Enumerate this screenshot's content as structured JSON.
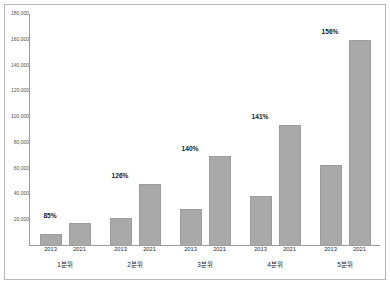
{
  "chart_data": {
    "type": "bar",
    "title": "",
    "subtitle": "",
    "xlabel": "",
    "ylabel": "",
    "categories": [
      "1분위",
      "2분위",
      "3분위",
      "4분위",
      "5분위"
    ],
    "series": [
      {
        "name": "2013",
        "values": [
          9500,
          21500,
          29000,
          39000,
          62500
        ]
      },
      {
        "name": "2021",
        "values": [
          17500,
          48500,
          69500,
          94000,
          160000
        ]
      }
    ],
    "growth_labels": [
      "85%",
      "126%",
      "140%",
      "141%",
      "156%"
    ],
    "ylim": [
      0,
      180000
    ],
    "ytick_values": [
      20000,
      40000,
      60000,
      80000,
      100000,
      120000,
      140000,
      160000,
      180000
    ],
    "ytick_labels": [
      "20,000",
      "40,000",
      "60,000",
      "80,000",
      "100,000",
      "120,000",
      "140,000",
      "160,000",
      "180,000"
    ],
    "grid": false,
    "legend": "none",
    "bar_color": "#a9a9a9",
    "axis_color": "#9a9a9a",
    "frame_color": "#b9b9b9",
    "text_color": "#1b1b1b"
  }
}
